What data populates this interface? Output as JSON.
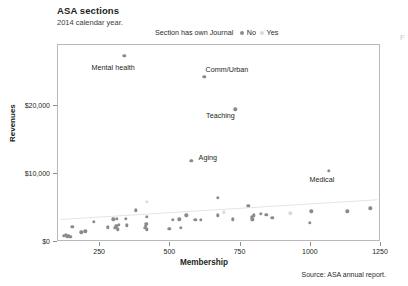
{
  "header": {
    "title": "ASA sections",
    "subtitle": "2014 calendar year.",
    "edge_fragment": "F"
  },
  "legend": {
    "title": "Section has own Journal",
    "items": [
      {
        "label": "No",
        "marker": "filled-dot",
        "color": "#8c8c8c"
      },
      {
        "label": "Yes",
        "marker": "open-dot",
        "color": "#d9d9d9"
      }
    ]
  },
  "footer": {
    "source": "Source: ASA annual report."
  },
  "chart_data": {
    "type": "scatter",
    "title": "ASA sections",
    "subtitle": "2014 calendar year.",
    "xlabel": "Membership",
    "ylabel": "Revenues",
    "xlim": [
      100,
      1250
    ],
    "ylim": [
      0,
      29000
    ],
    "xticks": [
      250,
      500,
      750,
      1000,
      1250
    ],
    "xticklabels": [
      "250",
      "500",
      "750",
      "1000",
      "1250"
    ],
    "yticks": [
      0,
      10000,
      20000
    ],
    "yticklabels": [
      "$0",
      "$10,000",
      "$20,000"
    ],
    "grid": false,
    "legend_position": "top-center",
    "trendline": {
      "x0": 110,
      "y0": 3300,
      "x1": 1240,
      "y1": 6200,
      "color": "#e4e4e4"
    },
    "annotations": [
      {
        "text": "Mental health",
        "x": 340,
        "y": 27300,
        "label_x": 300,
        "label_y": 25600
      },
      {
        "text": "Comm/Urban",
        "x": 625,
        "y": 24200,
        "label_x": 705,
        "label_y": 25300
      },
      {
        "text": "Teaching",
        "x": 735,
        "y": 19400,
        "label_x": 682,
        "label_y": 18600
      },
      {
        "text": "Aging",
        "x": 578,
        "y": 11800,
        "label_x": 637,
        "label_y": 12400
      },
      {
        "text": "Medical",
        "x": 1068,
        "y": 10300,
        "label_x": 1043,
        "label_y": 9100
      }
    ],
    "series": [
      {
        "name": "No",
        "marker": "filled",
        "color": "#8a8a8c",
        "points": [
          [
            340,
            27300
          ],
          [
            625,
            24200
          ],
          [
            735,
            19400
          ],
          [
            578,
            11800
          ],
          [
            1068,
            10300
          ],
          [
            672,
            6400
          ],
          [
            781,
            5200
          ],
          [
            381,
            4500
          ],
          [
            672,
            3800
          ],
          [
            1005,
            4400
          ],
          [
            1133,
            4400
          ],
          [
            1216,
            4800
          ],
          [
            800,
            3800
          ],
          [
            825,
            4000
          ],
          [
            845,
            3900
          ],
          [
            793,
            3500
          ],
          [
            795,
            3100
          ],
          [
            797,
            3300
          ],
          [
            866,
            3400
          ],
          [
            727,
            3200
          ],
          [
            560,
            3800
          ],
          [
            592,
            3100
          ],
          [
            613,
            3100
          ],
          [
            420,
            3600
          ],
          [
            301,
            3200
          ],
          [
            314,
            3300
          ],
          [
            345,
            3300
          ],
          [
            512,
            3100
          ],
          [
            535,
            3200
          ],
          [
            232,
            2800
          ],
          [
            1001,
            2700
          ],
          [
            281,
            2000
          ],
          [
            500,
            1800
          ],
          [
            541,
            1900
          ],
          [
            308,
            1900
          ],
          [
            311,
            2200
          ],
          [
            316,
            1700
          ],
          [
            321,
            2400
          ],
          [
            348,
            2300
          ],
          [
            412,
            1900
          ],
          [
            416,
            2200
          ],
          [
            418,
            2500
          ],
          [
            419,
            1700
          ],
          [
            155,
            2100
          ],
          [
            186,
            1300
          ],
          [
            201,
            1400
          ],
          [
            131,
            900
          ],
          [
            137,
            700
          ],
          [
            142,
            800
          ],
          [
            147,
            600
          ],
          [
            124,
            800
          ]
        ]
      },
      {
        "name": "Yes",
        "marker": "open",
        "color": "#dcdcdc",
        "points": [
          [
            420,
            5800
          ],
          [
            693,
            4200
          ],
          [
            930,
            4100
          ]
        ]
      }
    ]
  }
}
